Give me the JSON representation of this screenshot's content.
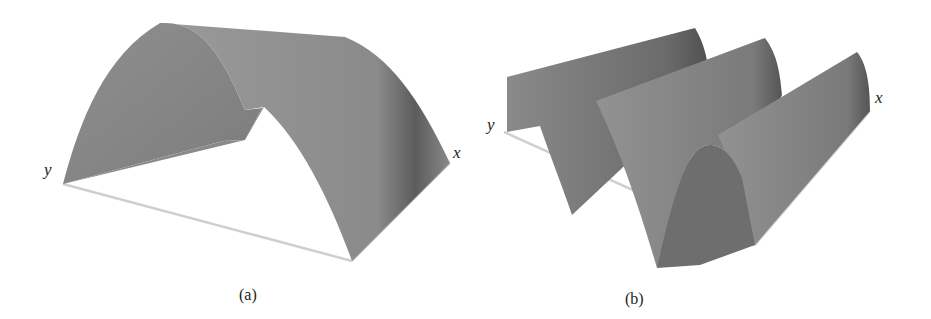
{
  "figure": {
    "panels": [
      {
        "id": "a",
        "caption": "(a)",
        "axis_labels": {
          "x": "x",
          "y": "y"
        },
        "description": "Single half-sine arch surface over a rectangular domain"
      },
      {
        "id": "b",
        "caption": "(b)",
        "axis_labels": {
          "x": "x",
          "y": "y"
        },
        "description": "Sinusoidal wave surface with multiple crests over a rectangular domain"
      }
    ],
    "colors": {
      "surface": "#8a8a8a",
      "surface_dark": "#5e5e5e",
      "surface_light": "#9c9c9c",
      "base_line": "#c8c8c8",
      "background": "#ffffff"
    }
  }
}
